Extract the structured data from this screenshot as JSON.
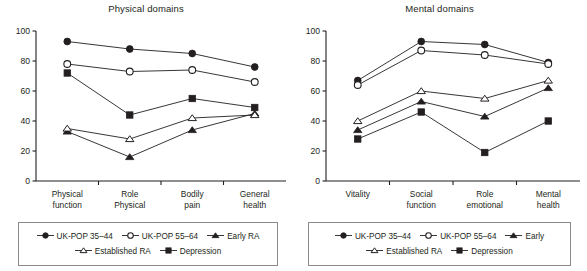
{
  "figure": {
    "width": 587,
    "height": 271,
    "background": "#ffffff",
    "ink_color": "#231f20"
  },
  "series_styles": [
    {
      "key": "uk_pop_35_44",
      "marker": "filled-circle",
      "label": "UK-POP 35–44"
    },
    {
      "key": "uk_pop_55_64",
      "marker": "open-circle",
      "label": "UK-POP 55–64"
    },
    {
      "key": "early_ra",
      "marker": "filled-triangle",
      "label": "Early RA"
    },
    {
      "key": "established_ra",
      "marker": "open-triangle",
      "label": "Established RA"
    },
    {
      "key": "depression",
      "marker": "filled-square",
      "label": "Depression"
    }
  ],
  "chart_data": [
    {
      "id": "physical",
      "type": "line",
      "title": "Physical domains",
      "xlabel": "",
      "ylabel": "",
      "ylim": [
        0,
        100
      ],
      "yticks": [
        0,
        20,
        40,
        60,
        80,
        100
      ],
      "grid": false,
      "legend_position": "bottom",
      "categories": [
        "Physical function",
        "Role Physical",
        "Bodily pain",
        "General health"
      ],
      "category_lines": [
        [
          "Physical",
          "function"
        ],
        [
          "Role",
          "Physical"
        ],
        [
          "Bodily",
          "pain"
        ],
        [
          "General",
          "health"
        ]
      ],
      "series": [
        {
          "name": "UK-POP 35–44",
          "marker": "filled-circle",
          "values": [
            93,
            88,
            85,
            76
          ]
        },
        {
          "name": "UK-POP 55–64",
          "marker": "open-circle",
          "values": [
            78,
            73,
            74,
            66
          ]
        },
        {
          "name": "Early RA",
          "marker": "filled-triangle",
          "values": [
            33,
            16,
            34,
            45
          ]
        },
        {
          "name": "Established RA",
          "marker": "open-triangle",
          "values": [
            35,
            28,
            42,
            44
          ]
        },
        {
          "name": "Depression",
          "marker": "filled-square",
          "values": [
            72,
            44,
            55,
            49
          ]
        }
      ],
      "legend": {
        "rows": [
          [
            "UK-POP 35–44",
            "UK-POP 55–64",
            "Early RA"
          ],
          [
            "Established RA",
            "Depression"
          ]
        ]
      }
    },
    {
      "id": "mental",
      "type": "line",
      "title": "Mental domains",
      "xlabel": "",
      "ylabel": "",
      "ylim": [
        0,
        100
      ],
      "yticks": [
        0,
        20,
        40,
        60,
        80,
        100
      ],
      "grid": false,
      "legend_position": "bottom",
      "categories": [
        "Vitality",
        "Social function",
        "Role emotional",
        "Mental health"
      ],
      "category_lines": [
        [
          "Vitality"
        ],
        [
          "Social",
          "function"
        ],
        [
          "Role",
          "emotional"
        ],
        [
          "Mental",
          "health"
        ]
      ],
      "series": [
        {
          "name": "UK-POP 35–44",
          "marker": "filled-circle",
          "values": [
            67,
            93,
            91,
            79
          ]
        },
        {
          "name": "UK-POP 55–64",
          "marker": "open-circle",
          "values": [
            64,
            87,
            84,
            78
          ]
        },
        {
          "name": "Early RA",
          "marker": "filled-triangle",
          "values": [
            34,
            53,
            43,
            62
          ]
        },
        {
          "name": "Established RA",
          "marker": "open-triangle",
          "values": [
            40,
            60,
            55,
            67
          ]
        },
        {
          "name": "Depression",
          "marker": "filled-square",
          "values": [
            28,
            46,
            19,
            40
          ]
        }
      ],
      "legend": {
        "rows": [
          [
            "UK-POP 35–44",
            "UK-POP 55–64",
            "Early"
          ],
          [
            "Established RA",
            "Depression"
          ]
        ]
      }
    }
  ]
}
